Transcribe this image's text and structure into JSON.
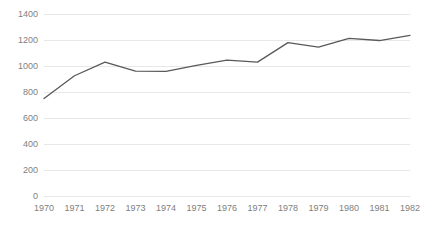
{
  "chart_data": {
    "type": "line",
    "title": "",
    "subtitle": "",
    "xlabel": "",
    "ylabel": "",
    "categories": [
      "1970",
      "1971",
      "1972",
      "1973",
      "1974",
      "1975",
      "1976",
      "1977",
      "1978",
      "1979",
      "1980",
      "1981",
      "1982"
    ],
    "x": [
      1970,
      1971,
      1972,
      1973,
      1974,
      1975,
      1976,
      1977,
      1978,
      1979,
      1980,
      1981,
      1982
    ],
    "series": [
      {
        "name": "",
        "values": [
          750,
          925,
          1030,
          960,
          958,
          1005,
          1045,
          1030,
          1180,
          1145,
          1213,
          1196,
          1235
        ]
      }
    ],
    "ylim": [
      0,
      1400
    ],
    "yticks": [
      0,
      200,
      400,
      600,
      800,
      1000,
      1200,
      1400
    ],
    "ytick_labels": [
      "0",
      "200",
      "400",
      "600",
      "800",
      "1000",
      "1200",
      "1400"
    ],
    "grid": true,
    "grid_axis": "y",
    "legend": false,
    "legend_position": "none",
    "line_color": "#595959",
    "line_width": 1.3,
    "markers": false,
    "gridline_color": "#e8e8e8",
    "tick_label_color": "#808080",
    "background_color": "#ffffff",
    "annotations": []
  },
  "axes": {
    "y_tick_labels": [
      "1400",
      "1200",
      "1000",
      "800",
      "600",
      "400",
      "200",
      "0"
    ],
    "x_tick_labels": [
      "1970",
      "1971",
      "1972",
      "1973",
      "1974",
      "1975",
      "1976",
      "1977",
      "1978",
      "1979",
      "1980",
      "1981",
      "1982"
    ]
  }
}
